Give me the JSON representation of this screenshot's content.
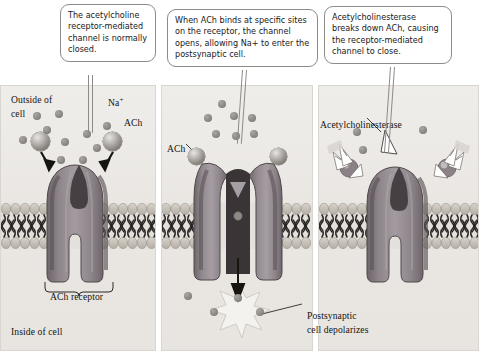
{
  "figure": {
    "type": "biology-diagram",
    "panel_count": 3
  },
  "callouts": {
    "panel1": "The acetylcholine receptor-mediated channel is normally closed.",
    "panel2": "When ACh binds at specific sites on the receptor, the channel opens, allowing Na+ to enter the postsynaptic cell.",
    "panel3": "Acetylcholinesterase breaks down ACh, causing the receptor-mediated channel to close."
  },
  "panel1": {
    "label_outside": "Outside of",
    "label_outside2": "cell",
    "label_na": "Na",
    "label_na_charge": "+",
    "label_ach": "ACh",
    "label_receptor": "ACh receptor",
    "label_inside": "Inside of cell",
    "state": "closed",
    "ions": [
      {
        "x": 36,
        "y": 30,
        "r": 4.4
      },
      {
        "x": 58,
        "y": 28,
        "r": 4.4
      },
      {
        "x": 46,
        "y": 42,
        "r": 4.2
      },
      {
        "x": 22,
        "y": 52,
        "r": 4.2
      },
      {
        "x": 60,
        "y": 52,
        "r": 4.2
      },
      {
        "x": 58,
        "y": 66,
        "r": 4.0
      },
      {
        "x": 80,
        "y": 46,
        "r": 4.0
      },
      {
        "x": 102,
        "y": 40,
        "r": 4.4
      },
      {
        "x": 90,
        "y": 58,
        "r": 4.2
      },
      {
        "x": 80,
        "y": 70,
        "r": 4.0
      }
    ],
    "ach_spheres": [
      {
        "x": 38,
        "y": 55,
        "r": 9.5
      },
      {
        "x": 106,
        "y": 55,
        "r": 9.5
      }
    ]
  },
  "panel2": {
    "label_ach": "ACh",
    "label_postsynaptic": "Postsynaptic",
    "label_depolarizes": "cell depolarizes",
    "state": "open",
    "ions_above": [
      {
        "x": 58,
        "y": 18,
        "r": 4.4
      },
      {
        "x": 44,
        "y": 30,
        "r": 4.4
      },
      {
        "x": 70,
        "y": 28,
        "r": 4.4
      },
      {
        "x": 86,
        "y": 30,
        "r": 4.4
      },
      {
        "x": 50,
        "y": 44,
        "r": 4.2
      },
      {
        "x": 72,
        "y": 46,
        "r": 4.2
      },
      {
        "x": 88,
        "y": 44,
        "r": 4.2
      }
    ],
    "ions_below": [
      {
        "x": 26,
        "y": 208,
        "r": 4.2
      },
      {
        "x": 50,
        "y": 222,
        "r": 4.2
      },
      {
        "x": 72,
        "y": 206,
        "r": 4.4
      },
      {
        "x": 96,
        "y": 220,
        "r": 4.2
      }
    ],
    "ach_bound": [
      {
        "x": 28,
        "y": 66,
        "r": 9.0
      },
      {
        "x": 98,
        "y": 66,
        "r": 9.0
      }
    ]
  },
  "panel3": {
    "label_enzyme": "Acetylcholinesterase",
    "state": "closing",
    "ions": [
      {
        "x": 34,
        "y": 44,
        "r": 4.4
      },
      {
        "x": 40,
        "y": 62,
        "r": 4.2
      },
      {
        "x": 100,
        "y": 42,
        "r": 4.4
      }
    ],
    "enzyme_wedges": [
      {
        "x": 62,
        "y": 46,
        "rot": 8
      },
      {
        "x": 20,
        "y": 78,
        "rot": -42
      },
      {
        "x": 110,
        "y": 78,
        "rot": 42
      }
    ]
  },
  "colors": {
    "panel_background": "#eae7e3",
    "receptor_light": "#9a9296",
    "receptor_dark": "#6f666b",
    "membrane_head": "#c9c4bd",
    "membrane_tail": "#2a2724",
    "callout_border": "#8e8a86",
    "ion": "#8d8a86",
    "text": "#15140f"
  }
}
